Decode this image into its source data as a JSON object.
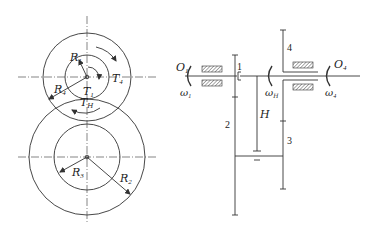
{
  "colors": {
    "line": "#333333",
    "hatch": "#555555",
    "background": "#ffffff"
  },
  "left_view": {
    "labels": {
      "R1": "R",
      "R1_sub": "1",
      "R4": "R",
      "R4_sub": "4",
      "T1": "T",
      "T1_sub": "1",
      "T4": "T",
      "T4_sub": "4",
      "TH": "T",
      "TH_sub": "H",
      "R3": "R",
      "R3_sub": "3",
      "R2": "R",
      "R2_sub": "2"
    }
  },
  "right_view": {
    "labels": {
      "O1": "O",
      "O1_sub": "1",
      "w1": "ω",
      "w1_sub": "1",
      "wH": "ω",
      "wH_sub": "H",
      "O4": "O",
      "O4_sub": "4",
      "w4": "ω",
      "w4_sub": "4",
      "H": "H",
      "gear1": "1",
      "gear2": "2",
      "gear3": "3",
      "gear4": "4"
    }
  }
}
